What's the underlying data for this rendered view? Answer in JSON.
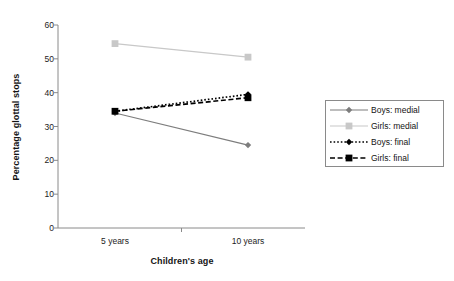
{
  "chart_data": {
    "type": "line",
    "title": "",
    "xlabel": "Children's age",
    "ylabel": "Percentage glottal stops",
    "categories": [
      "5 years",
      "10 years"
    ],
    "x": [
      5,
      10
    ],
    "ylim": [
      0,
      60
    ],
    "yticks": [
      0,
      10,
      20,
      30,
      40,
      50,
      60
    ],
    "ytick_labels": [
      "0",
      "10",
      "20",
      "30",
      "40",
      "50",
      "60"
    ],
    "grid": false,
    "legend_position": "right",
    "series": [
      {
        "name": "Boys: medial",
        "values": [
          34,
          24.5
        ],
        "color": "#7d7d7d",
        "line_style": "solid",
        "marker": "diamond"
      },
      {
        "name": "Girls: medial",
        "values": [
          54.5,
          50.5
        ],
        "color": "#c8c8c8",
        "line_style": "solid",
        "marker": "square"
      },
      {
        "name": "Boys: final",
        "values": [
          34.5,
          39.5
        ],
        "color": "#000000",
        "line_style": "dotted",
        "marker": "diamond"
      },
      {
        "name": "Girls: final",
        "values": [
          34.5,
          38.5
        ],
        "color": "#000000",
        "line_style": "dashed",
        "marker": "square"
      }
    ]
  },
  "axis": {
    "axis_color": "#8a8a8a",
    "tick_color": "#8a8a8a"
  },
  "legend": {
    "items": [
      {
        "label": "Boys: medial"
      },
      {
        "label": "Girls: medial"
      },
      {
        "label": "Boys: final"
      },
      {
        "label": "Girls: final"
      }
    ]
  }
}
